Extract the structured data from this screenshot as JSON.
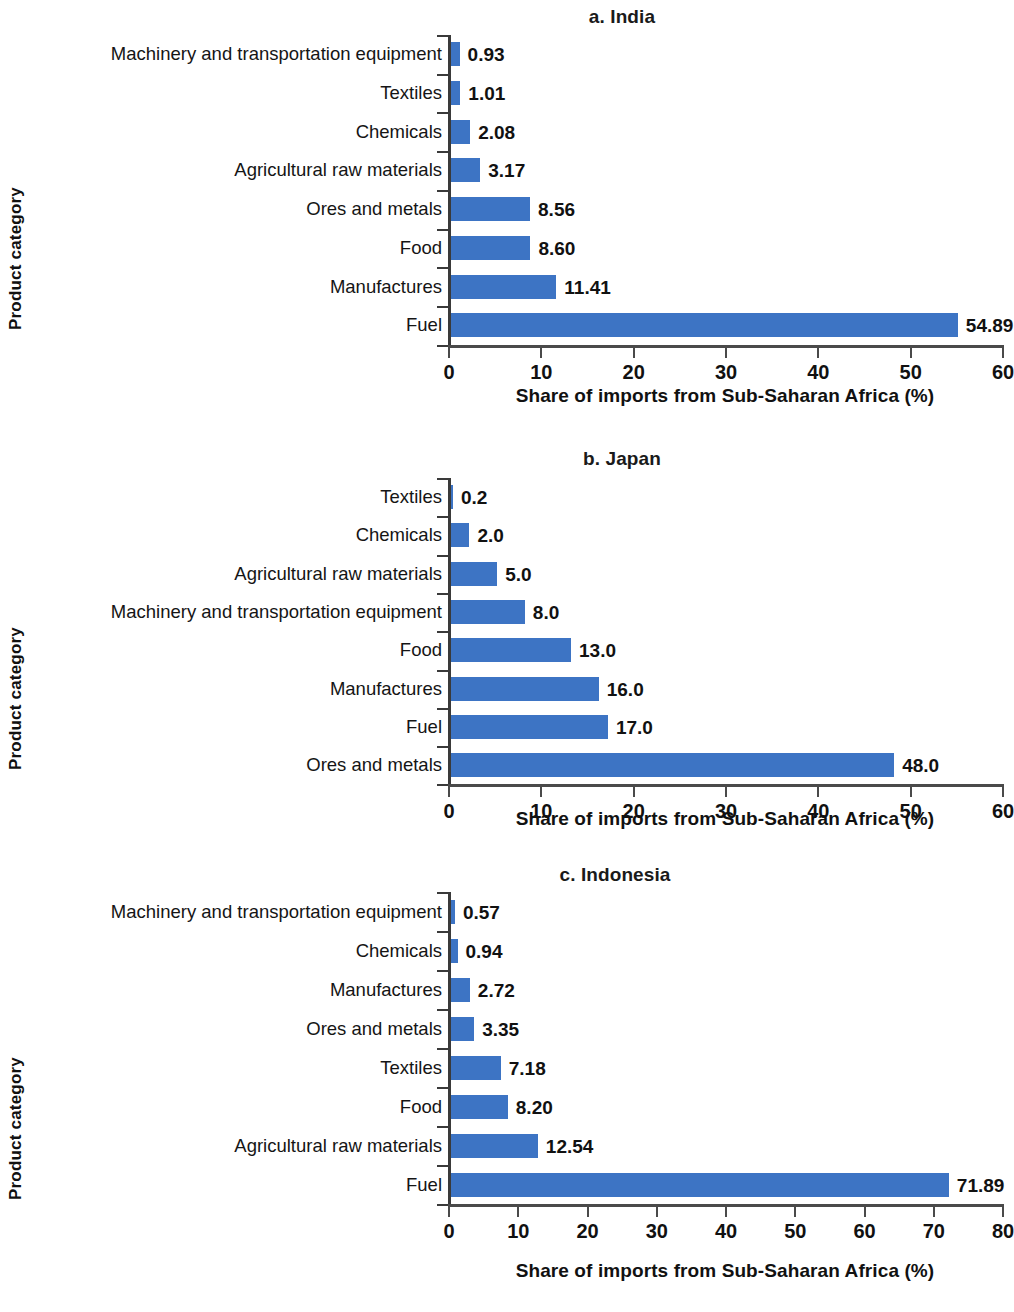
{
  "figure": {
    "axis_title_y": "Product category",
    "axis_title_x": "Share of imports from Sub-Saharan Africa (%)",
    "bar_color": "#3d74c4",
    "axis_color": "#3a3a3a"
  },
  "chart_data": [
    {
      "type": "bar",
      "orientation": "horizontal",
      "title": "a. India",
      "xlabel": "Share of imports from Sub-Saharan Africa (%)",
      "ylabel": "Product category",
      "xlim": [
        0,
        60
      ],
      "xticks": [
        0,
        10,
        20,
        30,
        40,
        50,
        60
      ],
      "grid": false,
      "legend": "none",
      "categories": [
        "Machinery and transportation equipment",
        "Textiles",
        "Chemicals",
        "Agricultural raw materials",
        "Ores and metals",
        "Food",
        "Manufactures",
        "Fuel"
      ],
      "values": [
        0.93,
        1.01,
        2.08,
        3.17,
        8.56,
        8.6,
        11.41,
        54.89
      ],
      "value_labels": [
        "0.93",
        "1.01",
        "2.08",
        "3.17",
        "8.56",
        "8.60",
        "11.41",
        "54.89"
      ]
    },
    {
      "type": "bar",
      "orientation": "horizontal",
      "title": "b. Japan",
      "xlabel": "Share of imports from Sub-Saharan Africa (%)",
      "ylabel": "Product category",
      "xlim": [
        0,
        60
      ],
      "xticks": [
        0,
        10,
        20,
        30,
        40,
        50,
        60
      ],
      "grid": false,
      "legend": "none",
      "categories": [
        "Textiles",
        "Chemicals",
        "Agricultural raw materials",
        "Machinery and transportation equipment",
        "Food",
        "Manufactures",
        "Fuel",
        "Ores and metals"
      ],
      "values": [
        0.2,
        2.0,
        5.0,
        8.0,
        13.0,
        16.0,
        17.0,
        48.0
      ],
      "value_labels": [
        "0.2",
        "2.0",
        "5.0",
        "8.0",
        "13.0",
        "16.0",
        "17.0",
        "48.0"
      ]
    },
    {
      "type": "bar",
      "orientation": "horizontal",
      "title": "c. Indonesia",
      "xlabel": "Share of imports from Sub-Saharan Africa (%)",
      "ylabel": "Product category",
      "xlim": [
        0,
        80
      ],
      "xticks": [
        0,
        10,
        20,
        30,
        40,
        50,
        60,
        70,
        80
      ],
      "grid": false,
      "legend": "none",
      "categories": [
        "Machinery and transportation equipment",
        "Chemicals",
        "Manufactures",
        "Ores and metals",
        "Textiles",
        "Food",
        "Agricultural raw materials",
        "Fuel"
      ],
      "values": [
        0.57,
        0.94,
        2.72,
        3.35,
        7.18,
        8.2,
        12.54,
        71.89
      ],
      "value_labels": [
        "0.57",
        "0.94",
        "2.72",
        "3.35",
        "7.18",
        "8.20",
        "12.54",
        "71.89"
      ]
    }
  ]
}
